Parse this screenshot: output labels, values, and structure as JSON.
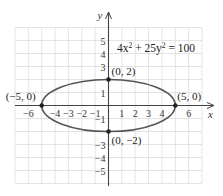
{
  "chart_data": {
    "type": "line",
    "title": "",
    "annotation_equation": {
      "base": "4x",
      "sup1": "2",
      "mid": " + 25y",
      "sup2": "2",
      "tail": " = 100"
    },
    "xlabel": "x",
    "ylabel": "y",
    "xlim": [
      -7,
      7
    ],
    "ylim": [
      -6,
      6
    ],
    "grid": true,
    "x_ticks": [
      {
        "value": -6,
        "label": "−6"
      },
      {
        "value": -4,
        "label": "−4"
      },
      {
        "value": -3,
        "label": "−3"
      },
      {
        "value": -2,
        "label": "−2"
      },
      {
        "value": -1,
        "label": "−1"
      },
      {
        "value": 1,
        "label": "1"
      },
      {
        "value": 2,
        "label": "2"
      },
      {
        "value": 3,
        "label": "3"
      },
      {
        "value": 4,
        "label": "4"
      },
      {
        "value": 6,
        "label": "6"
      }
    ],
    "y_ticks": [
      {
        "value": 5,
        "label": "5"
      },
      {
        "value": 4,
        "label": "4"
      },
      {
        "value": 3,
        "label": "3"
      },
      {
        "value": 1,
        "label": "1"
      },
      {
        "value": -1,
        "label": "−1"
      },
      {
        "value": -3,
        "label": "−3"
      },
      {
        "value": -4,
        "label": "−4"
      },
      {
        "value": -5,
        "label": "−5"
      }
    ],
    "series": [
      {
        "name": "ellipse 4x^2 + 25y^2 = 100",
        "shape": "ellipse",
        "center": [
          0,
          0
        ],
        "a": 5,
        "b": 2
      }
    ],
    "points": [
      {
        "x": -5,
        "y": 0,
        "label": "(−5, 0)"
      },
      {
        "x": 5,
        "y": 0,
        "label": "(5, 0)"
      },
      {
        "x": 0,
        "y": 2,
        "label": "(0, 2)"
      },
      {
        "x": 0,
        "y": -2,
        "label": "(0, −2)"
      }
    ],
    "colors": {
      "curve": "#555555",
      "grid": "#dddddd",
      "axis": "#444444",
      "point": "#222222"
    }
  }
}
